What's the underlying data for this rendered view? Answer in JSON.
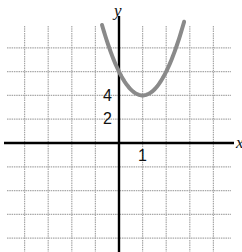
{
  "chart_data": {
    "type": "line",
    "title": "",
    "xlabel": "x",
    "ylabel": "y",
    "function": "y = 2x^2 - 4x + 6",
    "vertex": [
      1,
      4
    ],
    "y_intercept": 6,
    "x": [
      -0.7,
      -0.5,
      0,
      0.5,
      1,
      1.5,
      2,
      2.5,
      2.75
    ],
    "series": [
      {
        "name": "parabola",
        "values": [
          9.78,
          8.5,
          6,
          4.5,
          4,
          4.5,
          6,
          8.5,
          10.1
        ],
        "color": "#8a8a8a"
      }
    ],
    "tick_labels": {
      "x": [
        "1"
      ],
      "y": [
        "2",
        "4"
      ]
    },
    "xlim": [
      -5,
      5
    ],
    "ylim": [
      -9,
      11
    ],
    "x_grid_step": 1,
    "y_grid_step": 2,
    "grid": true,
    "legend": null
  },
  "labels": {
    "y_axis": "y",
    "x_axis": "x",
    "y_tick_4": "4",
    "y_tick_2": "2",
    "x_tick_1": "1"
  },
  "colors": {
    "grid": "#a8a8a8",
    "axis": "#000000",
    "curve": "#8a8a8a"
  }
}
